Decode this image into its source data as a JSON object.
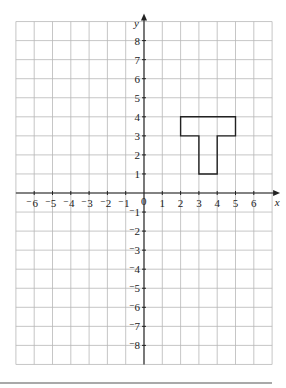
{
  "diagram": {
    "type": "coordinate-grid",
    "x_axis": {
      "label": "x",
      "min": -7,
      "max": 7,
      "tick_labels": [
        "-6",
        "-5",
        "-4",
        "-3",
        "-2",
        "-1",
        "1",
        "2",
        "3",
        "4",
        "5",
        "6"
      ]
    },
    "y_axis": {
      "label": "y",
      "min": -9,
      "max": 9,
      "tick_labels": [
        "8",
        "7",
        "6",
        "5",
        "4",
        "3",
        "2",
        "1",
        "-1",
        "-2",
        "-3",
        "-4",
        "-5",
        "-6",
        "-7",
        "-8"
      ]
    },
    "origin_label": "0",
    "shape": {
      "name": "T-shape",
      "vertices": [
        [
          2,
          4
        ],
        [
          5,
          4
        ],
        [
          5,
          3
        ],
        [
          4,
          3
        ],
        [
          4,
          1
        ],
        [
          3,
          1
        ],
        [
          3,
          3
        ],
        [
          2,
          3
        ]
      ]
    },
    "colors": {
      "grid": "#b8b8b8",
      "axis": "#222222",
      "shape": "#222222",
      "rule": "#555555"
    }
  }
}
